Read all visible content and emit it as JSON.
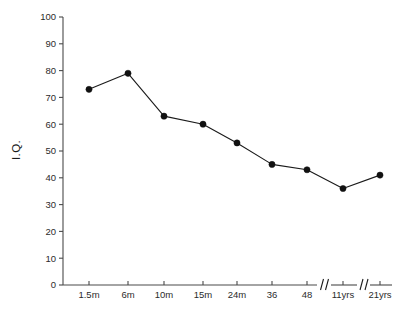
{
  "chart_data": {
    "type": "line",
    "title": "",
    "xlabel": "",
    "ylabel": "I.Q.",
    "ylim": [
      0,
      100
    ],
    "ytick_values": [
      0,
      10,
      20,
      30,
      40,
      50,
      60,
      70,
      80,
      90,
      100
    ],
    "ytick_labels": [
      "0",
      "10",
      "20",
      "30",
      "40",
      "50",
      "60",
      "70",
      "80",
      "90",
      "100"
    ],
    "categories": [
      "1.5m",
      "6m",
      "10m",
      "15m",
      "24m",
      "36",
      "48",
      "11yrs",
      "21yrs"
    ],
    "values": [
      73,
      79,
      63,
      60,
      53,
      45,
      43,
      36,
      41
    ],
    "series": [
      {
        "name": "I.Q.",
        "values": [
          73,
          79,
          63,
          60,
          53,
          45,
          43,
          36,
          41
        ]
      }
    ],
    "grid": false,
    "legend": "none",
    "axis_breaks": [
      {
        "after_category": "48",
        "before_category": "11yrs"
      },
      {
        "after_category": "11yrs",
        "before_category": "21yrs"
      }
    ],
    "marker": "filled-circle",
    "line_color": "#1a1a1a",
    "marker_color": "#111111",
    "axis_color": "#4a4a4a",
    "background_color": "#ffffff"
  }
}
